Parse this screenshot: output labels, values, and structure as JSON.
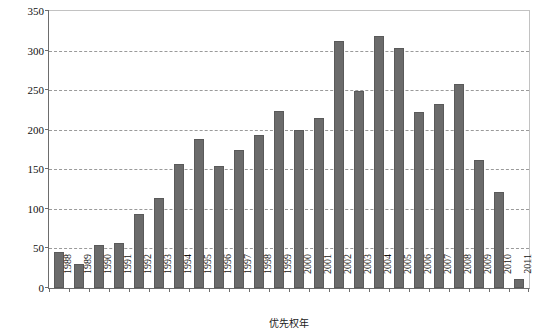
{
  "figure": {
    "clipped_top_caption": "",
    "background_color": "#ffffff",
    "bar_color": "#6b6b6b",
    "grid_color": "#9a9a9a",
    "axis_color": "#6d6d6d"
  },
  "chart_data": {
    "type": "bar",
    "title": "",
    "xlabel": "优先权年",
    "ylabel": "专利申请量/件",
    "ylim": [
      0,
      350
    ],
    "yticks": [
      0,
      50,
      100,
      150,
      200,
      250,
      300,
      350
    ],
    "grid": true,
    "legend": null,
    "categories": [
      "1988",
      "1989",
      "1990",
      "1991",
      "1992",
      "1993",
      "1994",
      "1995",
      "1996",
      "1997",
      "1998",
      "1999",
      "2000",
      "2001",
      "2002",
      "2003",
      "2004",
      "2005",
      "2006",
      "2007",
      "2008",
      "2009",
      "2010",
      "2011"
    ],
    "values": [
      46,
      30,
      54,
      57,
      93,
      114,
      157,
      188,
      154,
      175,
      193,
      224,
      200,
      215,
      312,
      249,
      318,
      303,
      222,
      232,
      258,
      162,
      121,
      11
    ]
  }
}
